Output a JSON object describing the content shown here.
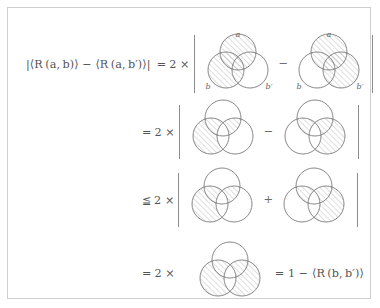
{
  "figure": {
    "background_color": "#ffffff",
    "frame_color": "#cfcfcf",
    "ink_color": "#555555",
    "circle_stroke_color": "#6b6b6b",
    "hatch_color": "#9a9a9a",
    "labels": {
      "a": "a",
      "b": "b",
      "b_prime": "b′"
    },
    "rows": [
      {
        "id": "row-1",
        "lhs": "|⟨R (a, b)⟩ − ⟨R (a, b′)⟩|",
        "relation": "=",
        "factor": "2 ×",
        "left_delimiter": "|",
        "right_delimiter": "|",
        "middle_operator": "−",
        "show_labels": true,
        "diagrams": [
          {
            "name": "venn-a-and-b",
            "shaded_regions": [
              "a",
              "a_and_b",
              "b_only"
            ]
          },
          {
            "name": "venn-a-and-bprime",
            "shaded_regions": [
              "a",
              "a_and_bprime",
              "bprime_only"
            ]
          }
        ]
      },
      {
        "id": "row-2",
        "lhs": "",
        "relation": "=",
        "factor": "2 ×",
        "left_delimiter": "|",
        "right_delimiter": "|",
        "middle_operator": "−",
        "show_labels": false,
        "diagrams": [
          {
            "name": "venn-b-minus-bprime-plus-a-bprime-lens",
            "shaded_regions": [
              "b_not_bprime",
              "a_and_bprime_not_b"
            ]
          },
          {
            "name": "venn-bprime-minus-b-plus-a-b-lens",
            "shaded_regions": [
              "bprime_not_b",
              "a_and_b_not_bprime"
            ]
          }
        ]
      },
      {
        "id": "row-3",
        "lhs": "",
        "relation": "≦",
        "factor": "2 ×",
        "left_delimiter": "|",
        "right_delimiter": "|",
        "middle_operator": "+",
        "show_labels": false,
        "diagrams": [
          {
            "name": "venn-b-minus-bprime-plus-a-bprime-lens",
            "shaded_regions": [
              "b_not_bprime",
              "a_and_bprime_not_b"
            ]
          },
          {
            "name": "venn-bprime-minus-b-plus-a-b-lens",
            "shaded_regions": [
              "bprime_not_b",
              "a_and_b_not_bprime"
            ]
          }
        ]
      },
      {
        "id": "row-4",
        "lhs": "",
        "relation": "=",
        "factor": "2 ×",
        "left_delimiter": "",
        "right_delimiter": "",
        "middle_operator": "",
        "show_labels": false,
        "tail": "= 1 − ⟨R (b, b′)⟩",
        "diagrams": [
          {
            "name": "venn-symmetric-difference-b-bprime",
            "shaded_regions": [
              "b_not_bprime",
              "bprime_not_b"
            ]
          }
        ]
      }
    ]
  }
}
